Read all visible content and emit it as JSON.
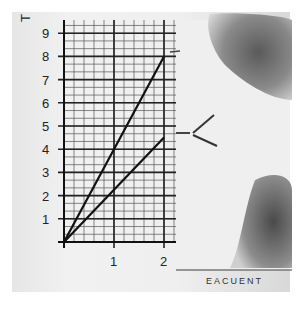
{
  "chart_data": {
    "type": "line",
    "title": "",
    "xlabel": "",
    "ylabel": "T...",
    "x_ticks": [
      "1",
      "2"
    ],
    "y_ticks": [
      "1",
      "2",
      "3",
      "4",
      "5",
      "6",
      "7",
      "8",
      "9"
    ],
    "xlim": [
      0,
      2.2
    ],
    "ylim": [
      0,
      9.5
    ],
    "grid": true,
    "series": [
      {
        "name": "steep line",
        "x": [
          0,
          2
        ],
        "y": [
          0,
          8
        ]
      },
      {
        "name": "shallow line",
        "x": [
          0,
          2
        ],
        "y": [
          0,
          4.5
        ]
      }
    ],
    "annotations": [
      {
        "type": "bracket",
        "shape": "<",
        "near": "shallow line end",
        "y": 4.6
      }
    ]
  },
  "labels": {
    "ylabel_fragment": "T",
    "footer_fragment": "EACUENT"
  }
}
